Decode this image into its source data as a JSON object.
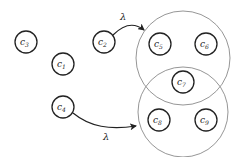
{
  "diagram": {
    "width": 244,
    "height": 157,
    "colors": {
      "node_stroke": "#222222",
      "cluster_stroke": "#8a8a8a",
      "arrow": "#222222",
      "background": "#ffffff"
    },
    "clusters": [
      {
        "id": "cluster-top",
        "cx": 183,
        "cy": 58,
        "r": 47
      },
      {
        "id": "cluster-bottom",
        "cx": 183,
        "cy": 112,
        "r": 45
      }
    ],
    "nodes": [
      {
        "id": "c3",
        "label": "c",
        "sub": "3",
        "cx": 26,
        "cy": 42
      },
      {
        "id": "c1",
        "label": "c",
        "sub": "1",
        "cx": 63,
        "cy": 64
      },
      {
        "id": "c2",
        "label": "c",
        "sub": "2",
        "cx": 104,
        "cy": 42
      },
      {
        "id": "c4",
        "label": "c",
        "sub": "4",
        "cx": 63,
        "cy": 107
      },
      {
        "id": "c5",
        "label": "c",
        "sub": "5",
        "cx": 160,
        "cy": 44
      },
      {
        "id": "c6",
        "label": "c",
        "sub": "6",
        "cx": 206,
        "cy": 44
      },
      {
        "id": "c7",
        "label": "c",
        "sub": "7",
        "cx": 183,
        "cy": 82
      },
      {
        "id": "c8",
        "label": "c",
        "sub": "8",
        "cx": 159,
        "cy": 120
      },
      {
        "id": "c9",
        "label": "c",
        "sub": "9",
        "cx": 206,
        "cy": 120
      }
    ],
    "node_radius": 11,
    "edges": [
      {
        "from": "c2",
        "to": "cluster-top",
        "label": "λ"
      },
      {
        "from": "c4",
        "to": "cluster-bottom",
        "label": "λ"
      }
    ]
  }
}
